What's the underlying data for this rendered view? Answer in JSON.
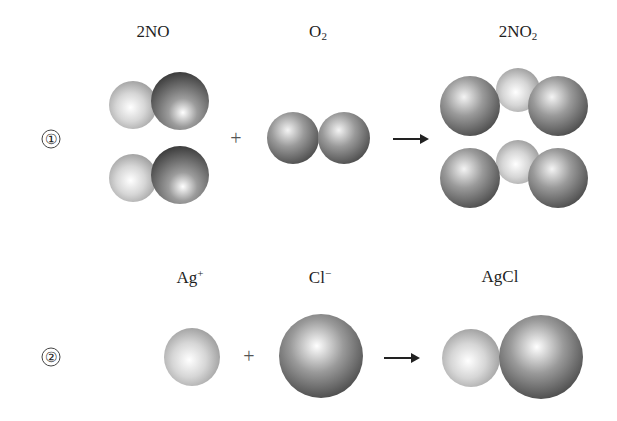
{
  "reaction1": {
    "number": "①",
    "reactant1": {
      "coef": "2",
      "formula": "NO",
      "sub": ""
    },
    "reactant2": {
      "coef": "",
      "formula": "O",
      "sub": "2"
    },
    "product": {
      "coef": "2",
      "formula": "NO",
      "sub": "2"
    },
    "plus": "+"
  },
  "reaction2": {
    "number": "②",
    "reactant1": {
      "formula": "Ag",
      "sup": "+"
    },
    "reactant2": {
      "formula": "Cl",
      "sup": "−"
    },
    "product": {
      "formula": "AgCl"
    },
    "plus": "+"
  },
  "colors": {
    "light_atom": "#c8c8c8",
    "dark_atom": "#6a6a6a",
    "medium_atom": "#808080",
    "arrow": "#222222"
  }
}
